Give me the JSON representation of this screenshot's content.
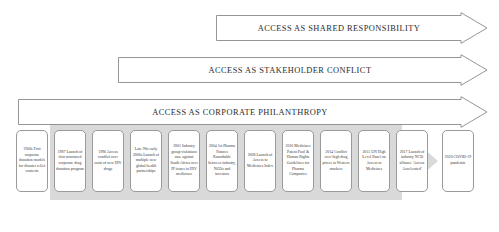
{
  "diagram": {
    "banners": [
      {
        "id": "shared-responsibility",
        "label": "ACCESS AS SHARED RESPONSIBILITY",
        "left": 216,
        "top": 12,
        "width": 272,
        "height": 32
      },
      {
        "id": "stakeholder-conflict",
        "label": "ACCESS AS STAKEHOLDER CONFLICT",
        "left": 118,
        "top": 54,
        "width": 370,
        "height": 32
      },
      {
        "id": "corporate-philanthropy",
        "label": "ACCESS AS CORPORATE PHILANTHROPY",
        "left": 18,
        "top": 96,
        "width": 470,
        "height": 32
      }
    ],
    "timeline": [
      {
        "year": "1960s",
        "text": "1960s First corporate donation models for disaster relief contexts",
        "left": 16,
        "width": 32
      },
      {
        "year": "1987",
        "text": "1987 Launch of first structured corporate drug donation program",
        "left": 54,
        "width": 32
      },
      {
        "year": "1996",
        "text": "1996 Access conflict over costs of new HIV drugs",
        "left": 92,
        "width": 32
      },
      {
        "year": "Late 90s-early 2000s",
        "text": "Late 90s-early 2000s Launch of multiple new global health partnerships",
        "left": 130,
        "width": 32
      },
      {
        "year": "2001",
        "text": "2001 Industry group violations case against South Africa over IP issues in HIV medicines",
        "left": 168,
        "width": 32
      },
      {
        "year": "2004",
        "text": "2004 1st Pharma Futures Roundtable between industry, NGOs and investors",
        "left": 206,
        "width": 32
      },
      {
        "year": "2008",
        "text": "2008 Launch of Access to Medicines Index",
        "left": 244,
        "width": 32
      },
      {
        "year": "2010",
        "text": "2010 Medicines Patent Pool & Human Rights Guidelines for Pharma Companies",
        "left": 282,
        "width": 32
      },
      {
        "year": "2014",
        "text": "2014 Conflict over high drug prices in Western markets",
        "left": 320,
        "width": 32
      },
      {
        "year": "2015",
        "text": "2015 UN High Level Panel on Access to Medicines",
        "left": 358,
        "width": 32
      },
      {
        "year": "2017",
        "text": "2017 Launch of industry NCD alliance 'Access Accelerated'",
        "left": 396,
        "width": 32
      },
      {
        "year": "2020",
        "text": "2020 COVID-19 pandemic",
        "left": 442,
        "width": 32
      }
    ],
    "colors": {
      "banner_outline": "#8a8a8a",
      "banner_fill": "#ffffff",
      "band_fill": "#d9d9d9",
      "box_outline": "#9a9a9a",
      "text": "#3a3a3a"
    }
  }
}
